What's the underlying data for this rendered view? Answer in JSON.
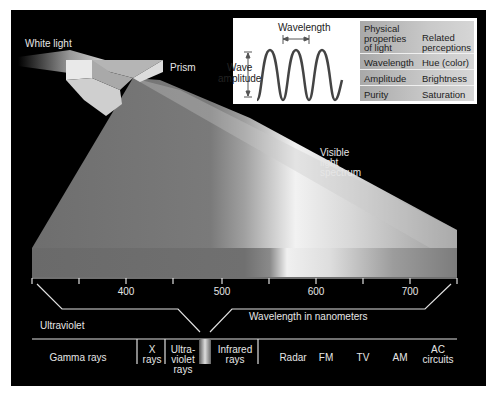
{
  "labels": {
    "white_light": "White light",
    "prism": "Prism",
    "visible_spectrum": [
      "Visible",
      "light",
      "spectrum"
    ],
    "wavelength_nm": "Wavelength in nanometers",
    "ultraviolet": "Ultraviolet"
  },
  "wave_diagram": {
    "wavelength_label": "Wavelength",
    "amplitude_label": [
      "Wave",
      "amplitude"
    ]
  },
  "properties_table": {
    "headers": [
      [
        "Physical",
        "properties",
        "of light"
      ],
      [
        "Related",
        "perceptions"
      ]
    ],
    "rows": [
      {
        "physical": "Wavelength",
        "perception": "Hue (color)"
      },
      {
        "physical": "Amplitude",
        "perception": "Brightness"
      },
      {
        "physical": "Purity",
        "perception": "Saturation"
      }
    ]
  },
  "axis": {
    "ticks": [
      "400",
      "500",
      "600",
      "700"
    ]
  },
  "em_spectrum": [
    {
      "label": [
        "Gamma rays"
      ]
    },
    {
      "label": [
        "X",
        "rays"
      ]
    },
    {
      "label": [
        "Ultra-",
        "violet",
        "rays"
      ]
    },
    {
      "label": [
        "Infrared",
        "rays"
      ]
    },
    {
      "label": [
        "Radar"
      ]
    },
    {
      "label": [
        "FM"
      ]
    },
    {
      "label": [
        "TV"
      ]
    },
    {
      "label": [
        "AM"
      ]
    },
    {
      "label": [
        "AC",
        "circuits"
      ]
    }
  ]
}
